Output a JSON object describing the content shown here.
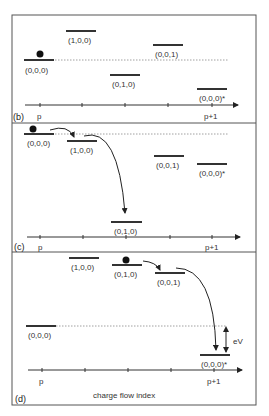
{
  "figure": {
    "x_axis_label": "charge flow index",
    "tick_labels": {
      "start": "p",
      "end": "p+1"
    },
    "panels": [
      {
        "id": "b",
        "label": "(b)",
        "levels": [
          "(0,0,0)",
          "(1,0,0)",
          "(0,1,0)",
          "(0,0,1)",
          "(0,0,0)*"
        ]
      },
      {
        "id": "c",
        "label": "(c)",
        "levels": [
          "(0,0,0)",
          "(1,0,0)",
          "(0,1,0)",
          "(0,0,1)",
          "(0,0,0)*"
        ]
      },
      {
        "id": "d",
        "label": "(d)",
        "levels": [
          "(0,0,0)",
          "(1,0,0)",
          "(0,1,0)",
          "(0,0,1)",
          "(0,0,0)*"
        ],
        "bias_label": "eV"
      }
    ]
  }
}
